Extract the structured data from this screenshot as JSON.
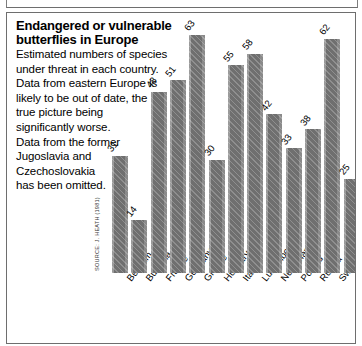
{
  "caption": {
    "title_line1": "Endangered or vulnerable",
    "title_line2": "butterflies in Europe",
    "body_lines": [
      "Estimated numbers of species",
      "under threat in each country.",
      "Data from eastern Europe is",
      "likely to be out of date, the",
      "true picture being",
      "significantly worse.",
      "Data from the former",
      "Jugoslavia and",
      "Czechoslovakia",
      "has been omitted."
    ]
  },
  "source": "SOURCE: J. HEATH (1981)",
  "colors": {
    "bar_fill": "#6f6f6f",
    "bar_highlight": "#9a9a9a",
    "frame": "#6e6e6e",
    "text": "#000000"
  },
  "chart_data": {
    "type": "bar",
    "title": "Endangered or vulnerable butterflies in Europe",
    "subtitle": "Estimated numbers of species under threat in each country.",
    "xlabel": "",
    "ylabel": "",
    "ylim": [
      0,
      63
    ],
    "grid": false,
    "legend": "none",
    "categories": [
      "Belgium",
      "Bulgaria",
      "France",
      "Germany",
      "Greece",
      "Hungary",
      "Italy",
      "Luxembourg",
      "Netherlands",
      "Poland",
      "Russia",
      "Switzerland",
      "United Kingdom"
    ],
    "values": [
      31,
      14,
      48,
      51,
      63,
      30,
      55,
      58,
      42,
      33,
      38,
      62,
      25
    ],
    "value_labels": [
      "31",
      "14",
      "48",
      "51",
      "63",
      "30",
      "55",
      "58",
      "42",
      "33",
      "38",
      "62",
      "25"
    ],
    "source": "SOURCE: J. HEATH (1981)"
  }
}
